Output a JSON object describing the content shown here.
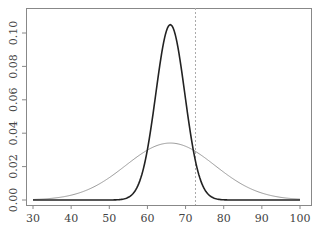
{
  "chart_data": {
    "type": "line",
    "title": "",
    "xlabel": "",
    "ylabel": "",
    "xlim": [
      28,
      101
    ],
    "ylim": [
      -0.003,
      0.115
    ],
    "x_ticks": [
      30,
      40,
      50,
      60,
      70,
      80,
      90,
      100
    ],
    "x_tick_labels": [
      "30",
      "40",
      "50",
      "60",
      "70",
      "80",
      "90",
      "100"
    ],
    "y_ticks": [
      0.0,
      0.02,
      0.04,
      0.06,
      0.08,
      0.1
    ],
    "y_tick_labels": [
      "0.00",
      "0.02",
      "0.04",
      "0.06",
      "0.08",
      "0.10"
    ],
    "grid": false,
    "legend": null,
    "series": [
      {
        "name": "narrow density",
        "kind": "normal",
        "mean": 66,
        "sd": 3.8,
        "x_range": [
          30,
          100
        ],
        "color": "#222222",
        "width": 1.6,
        "peak": 0.105
      },
      {
        "name": "wide density",
        "kind": "normal",
        "mean": 66,
        "sd": 11.7,
        "x_range": [
          30,
          100
        ],
        "color": "#999999",
        "width": 1,
        "peak": 0.034
      }
    ],
    "vlines": [
      {
        "x": 72.6,
        "style": "dotted",
        "color": "#aaaaaa"
      }
    ]
  },
  "layout": {
    "plot_box": {
      "left": 26,
      "top": 8,
      "right": 311,
      "bottom": 205
    },
    "x_pixel_map": {
      "v0": 30,
      "p0": 33,
      "v1": 100,
      "p1": 300
    },
    "y_pixel_map": {
      "v0": 0.0,
      "p0": 200,
      "v1": 0.1,
      "p1": 33
    }
  }
}
